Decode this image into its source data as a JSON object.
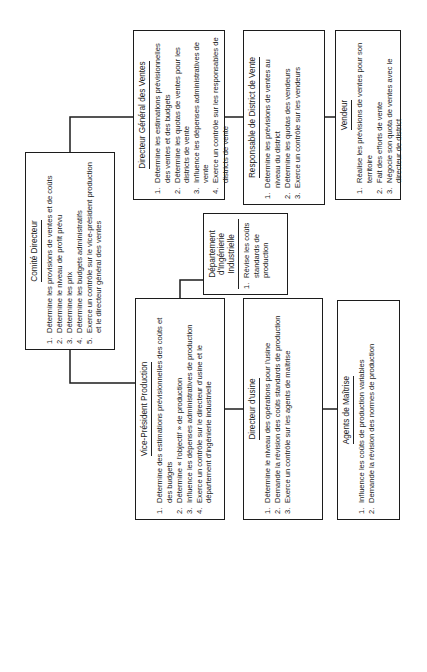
{
  "chart_title": "Organigramme budgétaire",
  "boxes": {
    "comite": {
      "title": "Comité Directeur",
      "items": [
        {
          "n": "1.",
          "t": "Détermine les provisions de ventes et de coûts"
        },
        {
          "n": "2.",
          "t": "Détermine le niveau de profit prévu"
        },
        {
          "n": "3.",
          "t": "Détermine les prix"
        },
        {
          "n": "4.",
          "t": "Détermine les budgets administratifs"
        },
        {
          "n": "5.",
          "t": "Exerce un contrôle sur le vice-président production et le directeur général des ventes"
        }
      ]
    },
    "dgv": {
      "title": "Directeur Général des Ventes",
      "items": [
        {
          "n": "1.",
          "t": "Détermine les estimations prévisionnelles des ventes et des budgets"
        },
        {
          "n": "2.",
          "t": "Détermine les quotas de ventes pour les districts de vente"
        },
        {
          "n": "3.",
          "t": "Influence les dépenses administratives de vente"
        },
        {
          "n": "4.",
          "t": "Exerce un contrôle sur les responsables de districts de vente"
        }
      ]
    },
    "rdv": {
      "title": "Responsable de District de Vente",
      "items": [
        {
          "n": "1.",
          "t": "Détermine les prévisions de ventes au niveau du district"
        },
        {
          "n": "2.",
          "t": "Détermine les quotas des vendeurs"
        },
        {
          "n": "3.",
          "t": "Exerce un contrôle sur les vendeurs"
        }
      ]
    },
    "vendeur": {
      "title": "Vendeur",
      "items": [
        {
          "n": "1.",
          "t": "Réalise les prévisions de ventes pour son territoire"
        },
        {
          "n": "2.",
          "t": "Fait des efforts de vente"
        },
        {
          "n": "3.",
          "t": "Négocie son quota de ventes avec le directeur de district"
        }
      ]
    },
    "ding": {
      "title": "Département d'Ingénierie Industrielle",
      "items": [
        {
          "n": "1.",
          "t": "Révise les coûts standards de production"
        }
      ]
    },
    "vpp": {
      "title": "Vice-Président Production",
      "items": [
        {
          "n": "1.",
          "t": "Détermine des estimations prévisionnelles des coûts et des budgets"
        },
        {
          "n": "2.",
          "t": "Détermine « l'objectif » de production"
        },
        {
          "n": "3.",
          "t": "Influence les dépenses administratives de production"
        },
        {
          "n": "4.",
          "t": "Exerce un contrôle sur le directeur d'usine et le département d'ingénierie industrielle"
        }
      ]
    },
    "usine": {
      "title": "Directeur d'usine",
      "items": [
        {
          "n": "1.",
          "t": "Détermine le niveau des opérations pour l'usine"
        },
        {
          "n": "2.",
          "t": "Demande la révision des coûts standards de production"
        },
        {
          "n": "3.",
          "t": "Exerce un contrôle sur les agents de maîtrise"
        }
      ]
    },
    "agents": {
      "title": "Agents de Maîtrise",
      "items": [
        {
          "n": "1.",
          "t": "Influence les coûts de production variables"
        },
        {
          "n": "2.",
          "t": "Demande la révision des normes de production"
        }
      ]
    }
  },
  "colors": {
    "ink": "#1c1c1c",
    "paper": "#ffffff"
  }
}
